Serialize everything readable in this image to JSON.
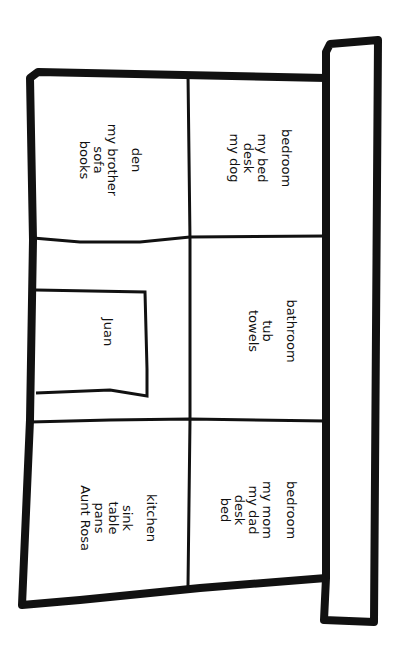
{
  "diagram": {
    "type": "house-floor-plan",
    "orientation": "rotated-90-clockwise",
    "colors": {
      "ink": "#111111",
      "paper": "#ffffff"
    },
    "rooms": [
      {
        "id": "bedroom-1",
        "title": "bedroom",
        "items": [
          "my bed",
          "desk",
          "my dog"
        ]
      },
      {
        "id": "den",
        "title": "den",
        "items": [
          "my brother",
          "sofa",
          "books"
        ]
      },
      {
        "id": "bathroom",
        "title": "bathroom",
        "items": [
          "tub",
          "towels"
        ]
      },
      {
        "id": "hall",
        "title": "",
        "items": [],
        "inner_box": {
          "label": "Juan"
        }
      },
      {
        "id": "bedroom-2",
        "title": "bedroom",
        "items": [
          "my mom",
          "my dad",
          "desk",
          "bed"
        ]
      },
      {
        "id": "kitchen",
        "title": "kitchen",
        "items": [
          "sink",
          "table",
          "pans",
          "Aunt Rosa"
        ]
      }
    ]
  }
}
